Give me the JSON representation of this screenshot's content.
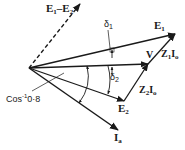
{
  "diagram": {
    "labels": {
      "e1_minus_e2": "E",
      "e1_minus_e2_sub1": "1",
      "e1_minus_e2_mid": "–E",
      "e1_minus_e2_sub2": "2",
      "e1": "E",
      "e1_sub": "1",
      "v": "V",
      "z1i0": "Z",
      "z1i0_sub": "1",
      "z1i0_i": "I",
      "z1i0_isub": "o",
      "e2": "E",
      "e2_sub": "2",
      "z2i0": "Z",
      "z2i0_sub": "2",
      "z2i0_i": "I",
      "z2i0_isub": "o",
      "ia": "I",
      "ia_sub": "a",
      "delta1": "δ",
      "delta1_sub": "1",
      "delta2": "δ",
      "delta2_sub": "2",
      "angle": "Cos",
      "angle_sup": "-1",
      "angle_val": "0·8"
    },
    "vectors": [
      {
        "name": "E1-E2",
        "style": "dashed",
        "from": [
          29,
          68
        ],
        "to": [
          80,
          4
        ]
      },
      {
        "name": "E1",
        "style": "solid",
        "from": [
          29,
          68
        ],
        "to": [
          175,
          34
        ]
      },
      {
        "name": "V",
        "style": "solid",
        "from": [
          29,
          68
        ],
        "to": [
          148,
          64
        ]
      },
      {
        "name": "E2",
        "style": "solid",
        "from": [
          29,
          68
        ],
        "to": [
          124,
          101
        ]
      },
      {
        "name": "Ia",
        "style": "solid",
        "from": [
          29,
          68
        ],
        "to": [
          118,
          130
        ]
      },
      {
        "name": "Z1I0",
        "style": "solid",
        "from": [
          148,
          64
        ],
        "to": [
          175,
          34
        ]
      },
      {
        "name": "Z2I0",
        "style": "solid",
        "from": [
          124,
          101
        ],
        "to": [
          148,
          64
        ]
      }
    ],
    "colors": {
      "ink": "#1a1a1a",
      "background": "#ffffff"
    }
  }
}
